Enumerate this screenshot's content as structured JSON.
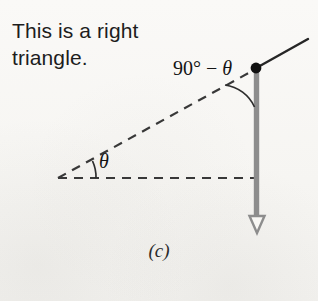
{
  "figure": {
    "caption": "This is a right triangle.",
    "figure_letter": "(c)",
    "labels": {
      "top_angle_prefix": "90° − ",
      "top_angle_symbol": "θ",
      "base_angle_symbol": "θ"
    },
    "colors": {
      "background": "#f8f7f4",
      "ink": "#1d1d1d",
      "dashed_line": "#3a3a3a",
      "vector_gray": "#8d8d8d",
      "vertex_dot": "#111111",
      "solid_ray": "#262626"
    },
    "geometry": {
      "left_vertex": [
        58,
        178
      ],
      "top_vertex": [
        256,
        68
      ],
      "right_angle_corner": [
        256,
        178
      ],
      "arrow_tip": [
        257,
        233
      ],
      "ray_end": [
        308,
        39
      ]
    }
  }
}
